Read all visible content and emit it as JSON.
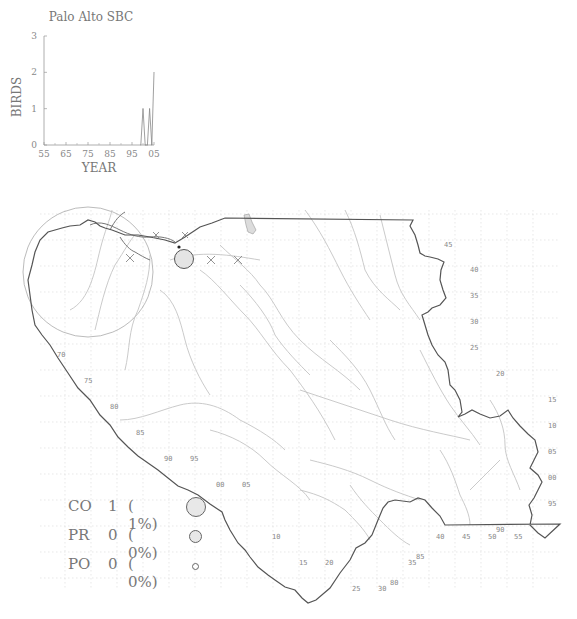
{
  "chart_data": {
    "type": "line",
    "title": "Palo Alto SBC",
    "xlabel": "YEAR",
    "ylabel": "BIRDS",
    "xlim": [
      1955,
      2005
    ],
    "ylim": [
      0,
      3
    ],
    "x_tick_labels": [
      "55",
      "65",
      "75",
      "85",
      "95",
      "05"
    ],
    "x_ticks": [
      1955,
      1965,
      1975,
      1985,
      1995,
      2005
    ],
    "y_tick_labels": [
      "0",
      "1",
      "2",
      "3"
    ],
    "y_ticks": [
      0,
      1,
      2,
      3
    ],
    "series": [
      {
        "name": "Birds",
        "x": [
          1999,
          2000,
          2001,
          2002,
          2003,
          2004,
          2005
        ],
        "y": [
          0,
          1,
          0,
          0,
          1,
          0,
          2
        ]
      }
    ]
  },
  "colors": {
    "boundary": "#555555",
    "river": "#bbbbbb",
    "grid": "#dddddd",
    "circle_fill": "#e6e6e6",
    "text": "#777777"
  },
  "map": {
    "right_labels": [
      "45",
      "40",
      "35",
      "30",
      "25",
      "20",
      "15",
      "10",
      "05",
      "00",
      "95"
    ],
    "left_labels": [
      "70",
      "75",
      "80",
      "85",
      "90",
      "95",
      "00",
      "05"
    ],
    "bottom_labels": [
      "10",
      "15",
      "20",
      "25",
      "30",
      "80",
      "85",
      "35",
      "40",
      "45",
      "50",
      "55",
      "90"
    ],
    "markers": [
      {
        "type": "x",
        "label": "absent"
      },
      {
        "type": "x",
        "label": "absent"
      },
      {
        "type": "x",
        "label": "absent"
      },
      {
        "type": "circle-large",
        "label": "CO"
      },
      {
        "type": "dot",
        "label": "site"
      }
    ]
  },
  "legend": {
    "rows": [
      {
        "code": "CO",
        "count": "1",
        "pct": "( 1%)",
        "size": "large"
      },
      {
        "code": "PR",
        "count": "0",
        "pct": "( 0%)",
        "size": "medium"
      },
      {
        "code": "PO",
        "count": "0",
        "pct": "( 0%)",
        "size": "small"
      }
    ]
  }
}
